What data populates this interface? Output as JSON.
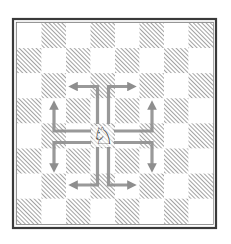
{
  "diagram": {
    "type": "chess-board",
    "board": {
      "files": 8,
      "ranks": 8,
      "origin_x": 17,
      "origin_y": 23,
      "square_w": 24.5,
      "square_h": 25.1,
      "top_left_color": "light",
      "light_color": "#ffffff",
      "dark_hatch_color": "#8a8a8a",
      "border_outer_color": "#3a3a3a",
      "border_inner_color": "#6a6a6a"
    },
    "piece": {
      "name": "white-knight",
      "glyph": "♘",
      "col": 3,
      "row": 4,
      "color": "#111111"
    },
    "arrow_color": "#8e8e8e",
    "moves": [
      {
        "name": "up-left",
        "path": [
          [
            97.5,
            124
          ],
          [
            97.5,
            86.5
          ],
          [
            74,
            86.5
          ]
        ]
      },
      {
        "name": "up-right",
        "path": [
          [
            108.5,
            124
          ],
          [
            108.5,
            86.5
          ],
          [
            131,
            86.5
          ]
        ]
      },
      {
        "name": "left-up",
        "path": [
          [
            91,
            131
          ],
          [
            54,
            131
          ],
          [
            54,
            106
          ]
        ]
      },
      {
        "name": "left-down",
        "path": [
          [
            91,
            142.5
          ],
          [
            54,
            142.5
          ],
          [
            54,
            167
          ]
        ]
      },
      {
        "name": "right-up",
        "path": [
          [
            114,
            131
          ],
          [
            152,
            131
          ],
          [
            152,
            106
          ]
        ]
      },
      {
        "name": "right-down",
        "path": [
          [
            114,
            142.5
          ],
          [
            152,
            142.5
          ],
          [
            152,
            167
          ]
        ]
      },
      {
        "name": "down-left",
        "path": [
          [
            97.5,
            147
          ],
          [
            97.5,
            185
          ],
          [
            74,
            185
          ]
        ]
      },
      {
        "name": "down-right",
        "path": [
          [
            108.5,
            147
          ],
          [
            108.5,
            185
          ],
          [
            131,
            185
          ]
        ]
      }
    ]
  }
}
